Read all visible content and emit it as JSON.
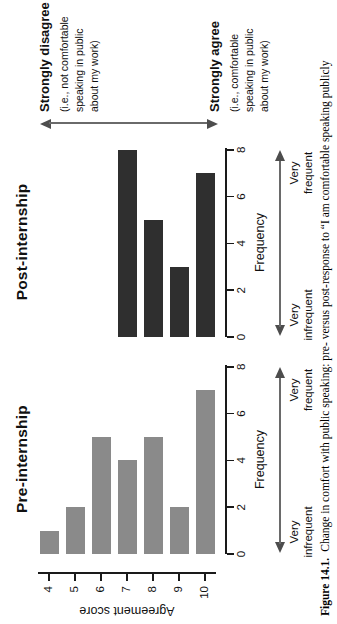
{
  "figure": {
    "caption_label": "Figure 14.1.",
    "caption_text": "Change in comfort with public speaking: pre- versus post-response to “I am comfortable speaking publicly"
  },
  "axes": {
    "score_axis_label": "Agreement score",
    "freq_axis_label": "Frequency",
    "scale_left_line1": "Very",
    "scale_left_line2": "infrequent",
    "scale_right_line1": "Very",
    "scale_right_line2": "frequent"
  },
  "annotations": {
    "disagree_title": "Strongly disagree",
    "disagree_line1": "(i.e., not comfortable",
    "disagree_line2": "speaking in public",
    "disagree_line3": "about my work)",
    "agree_title": "Strongly agree",
    "agree_line1": "(i.e., comfortable",
    "agree_line2": "speaking in public",
    "agree_line3": "about my work)"
  },
  "colors": {
    "pre_bar": "#8a8a8a",
    "post_bar": "#2f2f2f",
    "axis": "#1a1a1a",
    "arrow": "#5a5a5a"
  },
  "chart_data": [
    {
      "type": "bar",
      "orientation": "horizontal",
      "title": "Pre-internship",
      "categories": [
        4,
        5,
        6,
        7,
        8,
        9,
        10
      ],
      "values": [
        1,
        2,
        5,
        4,
        5,
        2,
        7
      ],
      "xlabel": "Frequency",
      "ylabel": "Agreement score",
      "xlim": [
        0,
        8
      ],
      "xticks": [
        0,
        2,
        4,
        6,
        8
      ],
      "bar_color": "#8a8a8a",
      "grid": false,
      "legend": "none"
    },
    {
      "type": "bar",
      "orientation": "horizontal",
      "title": "Post-internship",
      "categories": [
        4,
        5,
        6,
        7,
        8,
        9,
        10
      ],
      "values": [
        0,
        0,
        0,
        8,
        5,
        3,
        7
      ],
      "xlabel": "Frequency",
      "ylabel": "",
      "xlim": [
        0,
        8
      ],
      "xticks": [
        0,
        2,
        4,
        6,
        8
      ],
      "bar_color": "#2f2f2f",
      "grid": false,
      "legend": "none"
    }
  ]
}
